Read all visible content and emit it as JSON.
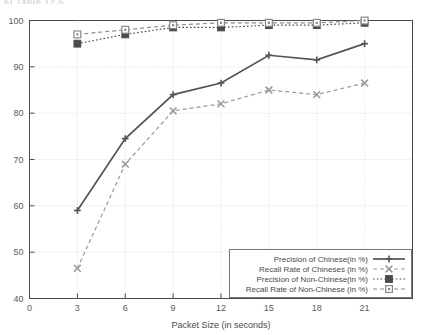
{
  "top_fragment": "AI   Table 12.5",
  "chart_data": {
    "type": "line",
    "title": "",
    "xlabel": "Packet Size (in seconds)",
    "ylabel": "",
    "x": [
      3,
      6,
      9,
      12,
      15,
      18,
      21
    ],
    "xlim": [
      0,
      24
    ],
    "ylim": [
      40,
      100
    ],
    "xticks": [
      0,
      3,
      6,
      9,
      12,
      15,
      18,
      21
    ],
    "yticks": [
      40,
      50,
      60,
      70,
      80,
      90,
      100
    ],
    "grid": true,
    "legend_position": "bottom-right",
    "series": [
      {
        "name": "Precision of Chinese(in %)",
        "values": [
          59,
          74.5,
          84,
          86.5,
          92.5,
          91.5,
          95
        ],
        "line_style": "solid",
        "marker": "plus",
        "color": "#555555"
      },
      {
        "name": "Recall Rate of Chineses (in %)",
        "values": [
          46.5,
          69,
          80.5,
          82,
          85,
          84,
          86.5
        ],
        "line_style": "dashed",
        "marker": "x",
        "color": "#9a9a9a"
      },
      {
        "name": "Precision of Non-Chinese(in %)",
        "values": [
          95,
          97,
          98.5,
          98.5,
          99,
          99,
          99.5
        ],
        "line_style": "dotted",
        "marker": "filled-square",
        "color": "#4a4a4a"
      },
      {
        "name": "Recall Rate of Non-Chinese (in %)",
        "values": [
          97,
          98,
          99,
          99.5,
          99.5,
          99.5,
          100
        ],
        "line_style": "dashed",
        "marker": "open-square",
        "color": "#8a8a8a"
      }
    ]
  }
}
